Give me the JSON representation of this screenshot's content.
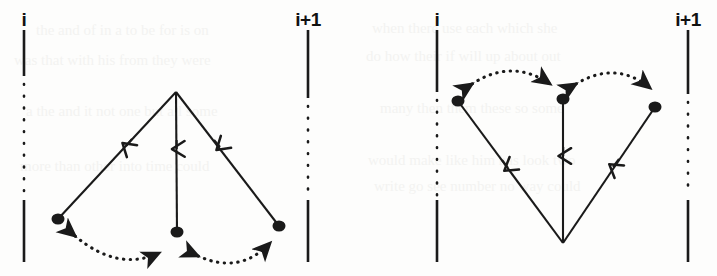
{
  "figure": {
    "background_color": "#fdfdfc",
    "ink_color": "#1a1a1a",
    "width": 717,
    "height": 276
  },
  "panels": [
    {
      "id": "left",
      "name": "panel-left",
      "shape": "fan-down",
      "apex": {
        "x": 176,
        "y": 92
      },
      "axes": [
        {
          "name": "axis-i",
          "label": "i",
          "x": 24,
          "label_x": 24,
          "label_y": 12
        },
        {
          "name": "axis-i-plus-1",
          "label": "i+1",
          "x": 308,
          "label_x": 308,
          "label_y": 12
        }
      ],
      "nodes": [
        {
          "name": "node-left",
          "x": 58,
          "y": 219
        },
        {
          "name": "node-middle",
          "x": 177,
          "y": 232
        },
        {
          "name": "node-right",
          "x": 279,
          "y": 226
        }
      ],
      "solid_edges": [
        {
          "name": "edge-apex-to-left",
          "from": "apex",
          "to": "node-left",
          "arrow_at": 0.42,
          "direction": "down"
        },
        {
          "name": "edge-apex-to-middle",
          "from": "apex",
          "to": "node-middle",
          "arrow_at": 0.4,
          "direction": "down"
        },
        {
          "name": "edge-apex-to-right",
          "from": "apex",
          "to": "node-right",
          "arrow_at": 0.42,
          "direction": "down"
        }
      ],
      "dotted_arcs": [
        {
          "name": "arc-left-middle",
          "from": "node-left",
          "to": "node-middle",
          "double_headed": true,
          "bulge": "down"
        },
        {
          "name": "arc-middle-right",
          "from": "node-middle",
          "to": "node-right",
          "double_headed": true,
          "bulge": "down"
        }
      ]
    },
    {
      "id": "right",
      "name": "panel-right",
      "shape": "fan-up",
      "apex": {
        "x": 203,
        "y": 243
      },
      "axes": [
        {
          "name": "axis-i",
          "label": "i",
          "x": 77,
          "label_x": 77,
          "label_y": 12
        },
        {
          "name": "axis-i-plus-1",
          "label": "i+1",
          "x": 328,
          "label_x": 328,
          "label_y": 12
        }
      ],
      "nodes": [
        {
          "name": "node-left",
          "x": 98,
          "y": 101
        },
        {
          "name": "node-middle",
          "x": 203,
          "y": 99
        },
        {
          "name": "node-right",
          "x": 295,
          "y": 107
        }
      ],
      "solid_edges": [
        {
          "name": "edge-left-to-apex",
          "from": "node-left",
          "to": "apex",
          "arrow_at": 0.48,
          "direction": "down"
        },
        {
          "name": "edge-middle-to-apex",
          "from": "node-middle",
          "to": "apex",
          "arrow_at": 0.4,
          "direction": "down"
        },
        {
          "name": "edge-right-to-apex",
          "from": "node-right",
          "to": "apex",
          "arrow_at": 0.48,
          "direction": "down"
        }
      ],
      "dotted_arcs": [
        {
          "name": "arc-left-middle",
          "from": "node-left",
          "to": "node-middle",
          "double_headed": true,
          "bulge": "up"
        },
        {
          "name": "arc-middle-right",
          "from": "node-middle",
          "to": "node-right",
          "double_headed": true,
          "bulge": "up"
        }
      ]
    }
  ],
  "labels": {
    "i": "i",
    "i_plus_1": "i+1"
  },
  "ghost_text": [
    {
      "text": "the and of in a to be for is on",
      "x": 36,
      "y": 22
    },
    {
      "text": "was that with his from they were",
      "x": 14,
      "y": 52
    },
    {
      "text": "a the and it not one but all some",
      "x": 26,
      "y": 103
    },
    {
      "text": "more than other into time could",
      "x": 20,
      "y": 158
    },
    {
      "text": "when there use each which she",
      "x": 372,
      "y": 20
    },
    {
      "text": "do how their if will up about out",
      "x": 366,
      "y": 48
    },
    {
      "text": "many then them these so some",
      "x": 380,
      "y": 100
    },
    {
      "text": "would make like him has look two",
      "x": 368,
      "y": 152
    },
    {
      "text": "write go see number no way could",
      "x": 374,
      "y": 178
    }
  ]
}
